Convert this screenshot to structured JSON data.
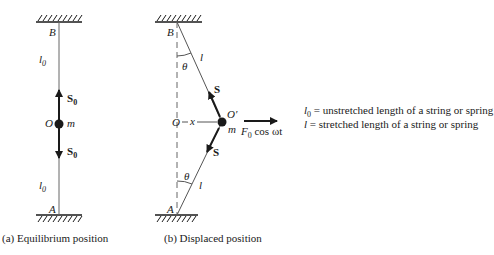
{
  "figure_a": {
    "caption": "(a)  Equilibrium position",
    "top_point": "B",
    "bottom_point": "A",
    "center_point": "O",
    "mass": "m",
    "length_label": "l",
    "length_sub": "0",
    "force_label": "S",
    "force_sub": "0"
  },
  "figure_b": {
    "caption": "(b)  Displaced position",
    "top_point": "B",
    "bottom_point": "A",
    "origin_point": "O",
    "displaced_point": "O′",
    "mass": "m",
    "displacement": "x",
    "length_label": "l",
    "angle_label": "θ",
    "force_label": "S",
    "applied_force": "F",
    "applied_force_sub": "0",
    "applied_force_rest": " cos ωt"
  },
  "legend": [
    {
      "symbol": "l",
      "sub": "0",
      "text": " = unstretched length of a string or spring"
    },
    {
      "symbol": "l",
      "sub": "",
      "text": "  = stretched length of a string or spring"
    }
  ],
  "colors": {
    "ink": "#1a1a1a",
    "line": "#555555"
  }
}
